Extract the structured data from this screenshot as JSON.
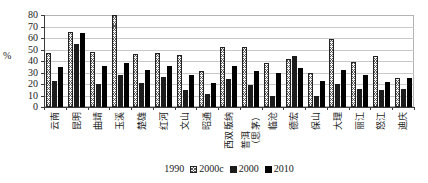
{
  "colors": {
    "background": "#ffffff",
    "gridline": "#c9c9c9",
    "axis": "#3c3c3c",
    "bar_hatch_foreground": "#5a5a5a",
    "bar_dark": "#1c1c1c",
    "bar_black": "#000000",
    "text": "#1a1a1a"
  },
  "chart_data": {
    "type": "bar",
    "title": "",
    "xlabel": "",
    "ylabel": "%",
    "ylim": [
      0,
      80
    ],
    "yticks": [
      80,
      70,
      60,
      50,
      40,
      30,
      20,
      10,
      0
    ],
    "grid": true,
    "legend_position": "bottom",
    "legend_display": [
      {
        "label": "1990",
        "swatch": "none"
      },
      {
        "label": "2000c",
        "swatch": "hatched"
      },
      {
        "label": "2000",
        "swatch": "solid-dark"
      },
      {
        "label": "2010",
        "swatch": "solid-black"
      }
    ],
    "categories": [
      "云南",
      "昆明",
      "曲靖",
      "玉溪",
      "楚雄",
      "红河",
      "文山",
      "昭通",
      "西双版纳",
      "普洱（思茅）",
      "临沧",
      "德宏",
      "保山",
      "大理",
      "丽江",
      "怒江",
      "迪庆"
    ],
    "series": [
      {
        "name": "1990",
        "style": "hatched",
        "values": [
          47,
          65,
          48,
          80,
          46,
          47,
          45,
          31,
          52,
          52,
          38,
          42,
          30,
          59,
          39,
          44,
          25
        ]
      },
      {
        "name": "2000",
        "style": "solid-dark",
        "values": [
          23,
          55,
          20,
          28,
          21,
          26,
          15,
          11,
          24,
          19,
          10,
          44,
          10,
          20,
          16,
          15,
          16
        ]
      },
      {
        "name": "2010",
        "style": "solid-black",
        "values": [
          35,
          64,
          36,
          38,
          32,
          36,
          28,
          21,
          36,
          31,
          30,
          34,
          23,
          32,
          28,
          22,
          25
        ]
      }
    ]
  }
}
